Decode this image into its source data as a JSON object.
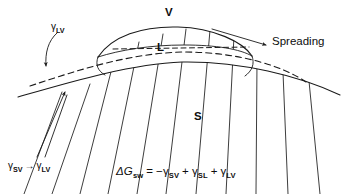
{
  "figure": {
    "caption_type": "schematic-diagram",
    "ink_color": "#1a1a1a",
    "background_color": "#ffffff"
  },
  "phase_labels": {
    "vapor": "V",
    "liquid": "L",
    "solid": "S"
  },
  "annotations": {
    "gamma_lv_top": {
      "symbol": "γ",
      "subscript": "LV"
    },
    "gamma_transition": {
      "from_symbol": "γ",
      "from_subscript": "SV",
      "arrow": "→",
      "to_symbol": "γ",
      "to_subscript": "LV"
    },
    "spreading": "Spreading"
  },
  "equation": {
    "delta": "Δ",
    "g_symbol": "G",
    "g_subscript": "sw",
    "equals": "=",
    "term1_sign": "−",
    "term1_symbol": "γ",
    "term1_subscript": "SV",
    "term2_sign": "+",
    "term2_symbol": "γ",
    "term2_subscript": "SL",
    "term3_sign": "+",
    "term3_symbol": "γ",
    "term3_subscript": "LV",
    "plain_text": "ΔG_sw = −γ_SV + γ_SL + γ_LV"
  },
  "geometry": {
    "solid_surface_path": "M 18 97 C 70 82 130 64 182 62 C 240 61 300 76 340 95",
    "dashed_film_path": "M 30 86 C 78 70 130 53 184 52 C 238 52 283 66 306 82",
    "liquid_lens_top_path": "M 98 57 C 112 36 142 26 178 27 C 214 28 243 42 252 56",
    "liquid_lens_base_path": "M 98 57 C 120 50 150 45 184 45 C 216 45 240 49 252 56",
    "liquid_interior_dash_path": "M 112 48 L 248 47",
    "lens_left_foot_path": "M 98 57 C 96 64 98 70 104 74",
    "lens_right_foot_path": "M 252 56 C 254 63 252 70 246 75",
    "hatch_lines": [
      {
        "x1": 24,
        "y1": 194,
        "x2": 62,
        "y2": 92
      },
      {
        "x1": 52,
        "y1": 194,
        "x2": 90,
        "y2": 84
      },
      {
        "x1": 80,
        "y1": 194,
        "x2": 115,
        "y2": 56
      },
      {
        "x1": 108,
        "y1": 194,
        "x2": 139,
        "y2": 42
      },
      {
        "x1": 137,
        "y1": 194,
        "x2": 163,
        "y2": 34
      },
      {
        "x1": 166,
        "y1": 194,
        "x2": 186,
        "y2": 29
      },
      {
        "x1": 196,
        "y1": 194,
        "x2": 210,
        "y2": 30
      },
      {
        "x1": 226,
        "y1": 194,
        "x2": 234,
        "y2": 36
      },
      {
        "x1": 256,
        "y1": 194,
        "x2": 257,
        "y2": 62
      },
      {
        "x1": 288,
        "y1": 194,
        "x2": 283,
        "y2": 72
      },
      {
        "x1": 320,
        "y1": 194,
        "x2": 309,
        "y2": 81
      }
    ],
    "callout_gamma_lv": {
      "curve": "M 56 33 C 48 40 45 52 46 62",
      "arrow_tip": [
        46,
        70
      ]
    },
    "callout_gamma_sv": {
      "line_a": "M 37 158 L 66 88",
      "line_b": "M 44 158 L 67 88",
      "arrow_tip": [
        66,
        84
      ]
    },
    "callout_spreading": {
      "line": "M 213 29 L 268 45",
      "arrow_tip": [
        272,
        46
      ]
    }
  }
}
